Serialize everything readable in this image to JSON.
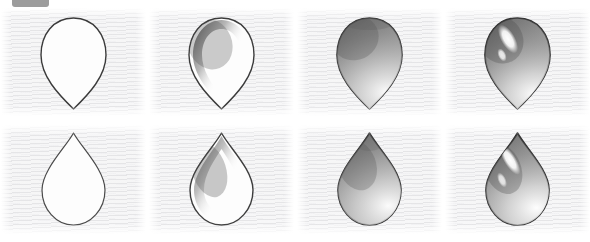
{
  "badge": {
    "name": "top-left-gray-pill-badge",
    "color": "#9c9c9c",
    "label": ""
  },
  "page": {
    "background": "#ffffff",
    "paper_color": "#f6f6f6",
    "graphite_color": "#4a4a4a",
    "outline_color": "#3a3a3a",
    "highlight_color": "#ffffff",
    "columns": 4,
    "rows": 2
  },
  "panels": [
    {
      "id": "r1c1",
      "row": 1,
      "column": 1,
      "shape": "teardrop-point-down",
      "step": "outline",
      "caption": "Step 1 - contour outline only, no shading",
      "shading": "none",
      "highlight": "none"
    },
    {
      "id": "r1c2",
      "row": 1,
      "column": 2,
      "shape": "teardrop-point-down",
      "step": "crescent-shadow",
      "caption": "Step 2 - dark crescent along upper-left inner edge",
      "shading": "upper-left-crescent",
      "highlight": "none"
    },
    {
      "id": "r1c3",
      "row": 1,
      "column": 3,
      "shape": "teardrop-point-down",
      "step": "full-tone",
      "caption": "Step 3 - whole form filled with graphite, light at lower-right",
      "shading": "full-gradient",
      "highlight": "soft-lower-right"
    },
    {
      "id": "r1c4",
      "row": 1,
      "column": 4,
      "shape": "teardrop-point-down",
      "step": "specular-highlight",
      "caption": "Step 4 - glossy specular highlight added upper-left",
      "shading": "full-gradient",
      "highlight": "specular-upper-left"
    },
    {
      "id": "r2c1",
      "row": 2,
      "column": 1,
      "shape": "teardrop-point-up",
      "step": "outline",
      "caption": "Step 1 - contour outline only, no shading",
      "shading": "none",
      "highlight": "none"
    },
    {
      "id": "r2c2",
      "row": 2,
      "column": 2,
      "shape": "teardrop-point-up",
      "step": "crescent-shadow",
      "caption": "Step 2 - dark crescent along upper-left inner edge",
      "shading": "upper-left-crescent",
      "highlight": "none"
    },
    {
      "id": "r2c3",
      "row": 2,
      "column": 3,
      "shape": "teardrop-point-up",
      "step": "full-tone",
      "caption": "Step 3 - whole form filled with graphite, light at lower-right",
      "shading": "full-gradient",
      "highlight": "soft-lower-right"
    },
    {
      "id": "r2c4",
      "row": 2,
      "column": 4,
      "shape": "teardrop-point-up",
      "step": "specular-highlight",
      "caption": "Step 4 - glossy specular highlight added upper-left",
      "shading": "full-gradient",
      "highlight": "specular-upper-left"
    }
  ]
}
